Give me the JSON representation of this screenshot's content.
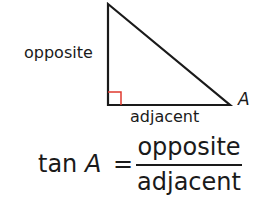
{
  "triangle": {
    "vertices": {
      "top": [
        108,
        4
      ],
      "right_angle": [
        108,
        105
      ],
      "angle_A": [
        230,
        105
      ]
    },
    "stroke_color": "#1a1a1a",
    "right_angle_marker_color": "#e03a2f",
    "labels": {
      "opposite": "opposite",
      "adjacent": "adjacent",
      "angle": "A"
    }
  },
  "formula": {
    "function": "tan",
    "variable": "A",
    "equals": "=",
    "numerator": "opposite",
    "denominator": "adjacent"
  }
}
